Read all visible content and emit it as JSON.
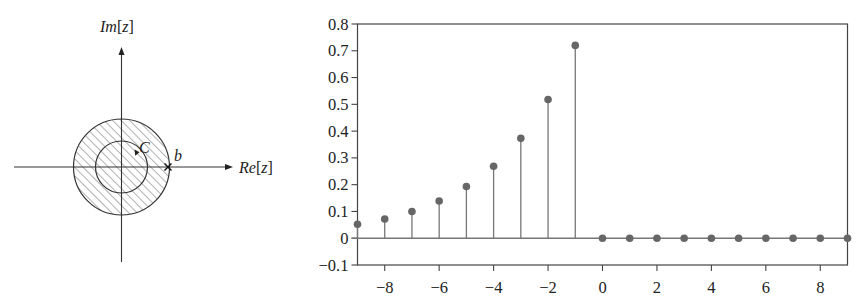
{
  "figure": {
    "left_panel": {
      "type": "z-plane diagram",
      "axis_labels": {
        "imag": "Im[z]",
        "real": "Re[z]"
      },
      "im_label_parts": {
        "a": "Im",
        "b": "[",
        "c": "z",
        "d": "]"
      },
      "re_label_parts": {
        "a": "Re",
        "b": "[",
        "c": "z",
        "d": "]"
      },
      "contour_label": "C",
      "pole_label": "b",
      "pole_marker": "x",
      "region": "hatched disk |z| < b",
      "colors": {
        "line": "#333333",
        "hatch": "#555555"
      }
    },
    "right_panel": {
      "colors": {
        "stem": "#777777",
        "marker": "#666666",
        "frame": "#444444",
        "baseline": "#777777"
      }
    }
  },
  "chart_data": {
    "type": "stem",
    "title": "",
    "xlabel": "",
    "ylabel": "",
    "xlim": [
      -9,
      9
    ],
    "ylim": [
      -0.1,
      0.8
    ],
    "grid": false,
    "legend": null,
    "x_ticks": [
      -8,
      -6,
      -4,
      -2,
      0,
      2,
      4,
      6,
      8
    ],
    "x_tick_labels": [
      "−8",
      "−6",
      "−4",
      "−2",
      "0",
      "2",
      "4",
      "6",
      "8"
    ],
    "y_ticks": [
      -0.1,
      0,
      0.1,
      0.2,
      0.3,
      0.4,
      0.5,
      0.6,
      0.7,
      0.8
    ],
    "y_tick_labels": [
      "−0.1",
      "0",
      "0.1",
      "0.2",
      "0.3",
      "0.4",
      "0.5",
      "0.6",
      "0.7",
      "0.8"
    ],
    "x": [
      -9,
      -8,
      -7,
      -6,
      -5,
      -4,
      -3,
      -2,
      -1,
      0,
      1,
      2,
      3,
      4,
      5,
      6,
      7,
      8,
      9
    ],
    "values": [
      0.052,
      0.072,
      0.1,
      0.139,
      0.193,
      0.269,
      0.373,
      0.518,
      0.72,
      0,
      0,
      0,
      0,
      0,
      0,
      0,
      0,
      0,
      0
    ]
  }
}
